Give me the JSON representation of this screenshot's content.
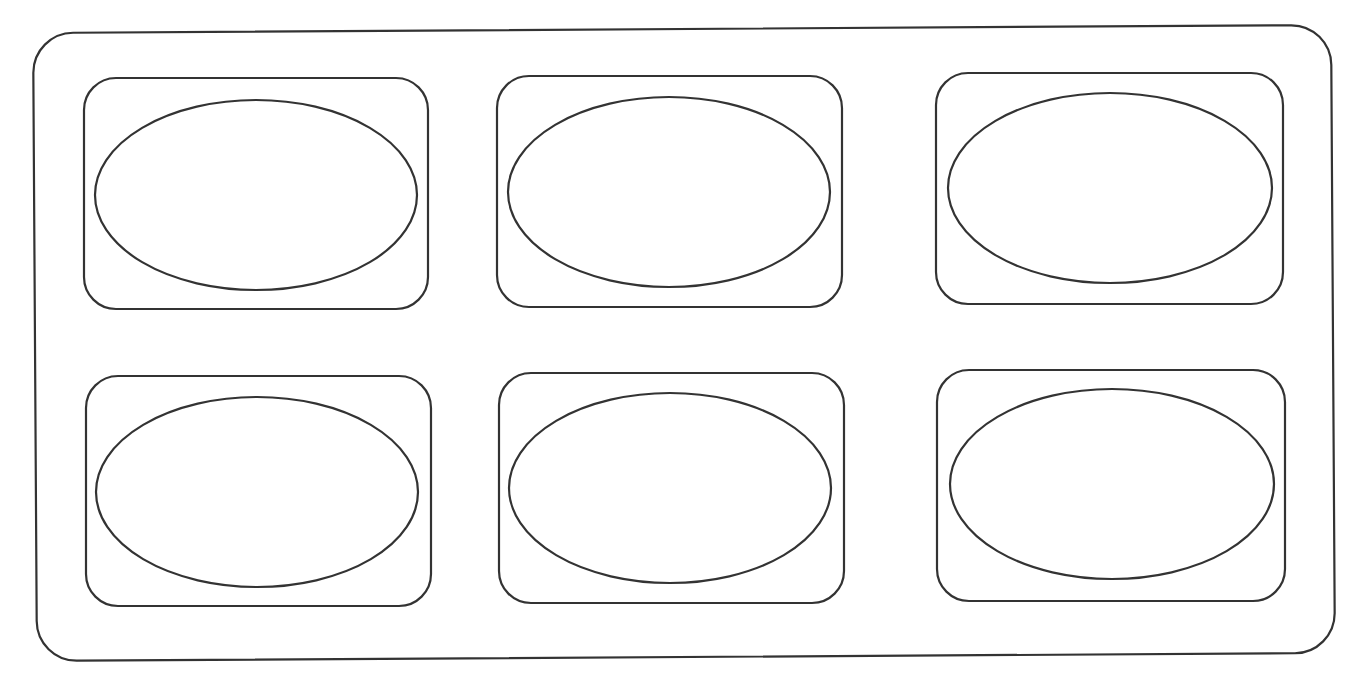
{
  "diagram": {
    "stroke_color": "#333333",
    "background": "#ffffff",
    "outer": {
      "x": 35,
      "y": 29,
      "w": 1298,
      "h": 628,
      "r": 40
    },
    "cards": [
      {
        "x": 84,
        "y": 78,
        "w": 344,
        "h": 231,
        "r": 32,
        "ellipse": {
          "cx": 256,
          "cy": 195,
          "rx": 161,
          "ry": 95
        }
      },
      {
        "x": 497,
        "y": 76,
        "w": 345,
        "h": 231,
        "r": 32,
        "ellipse": {
          "cx": 669,
          "cy": 192,
          "rx": 161,
          "ry": 95
        }
      },
      {
        "x": 936,
        "y": 73,
        "w": 347,
        "h": 231,
        "r": 32,
        "ellipse": {
          "cx": 1110,
          "cy": 188,
          "rx": 162,
          "ry": 95
        }
      },
      {
        "x": 86,
        "y": 376,
        "w": 345,
        "h": 230,
        "r": 32,
        "ellipse": {
          "cx": 257,
          "cy": 492,
          "rx": 161,
          "ry": 95
        }
      },
      {
        "x": 499,
        "y": 373,
        "w": 345,
        "h": 230,
        "r": 32,
        "ellipse": {
          "cx": 670,
          "cy": 488,
          "rx": 161,
          "ry": 95
        }
      },
      {
        "x": 937,
        "y": 370,
        "w": 348,
        "h": 231,
        "r": 32,
        "ellipse": {
          "cx": 1112,
          "cy": 484,
          "rx": 162,
          "ry": 95
        }
      }
    ]
  }
}
